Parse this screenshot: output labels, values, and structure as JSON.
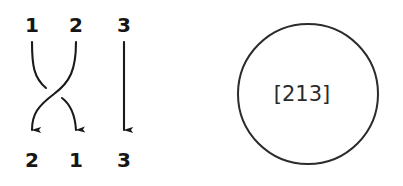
{
  "figure": {
    "background_color": "#ffffff",
    "ink_color": "#1a1a1a",
    "width": 403,
    "height": 186
  },
  "braid_diagram": {
    "name": "permutation-braid-diagram",
    "stroke_color": "#1a1a1a",
    "top_labels": [
      {
        "text": "1",
        "x": 32,
        "y": 25
      },
      {
        "text": "2",
        "x": 76,
        "y": 25
      },
      {
        "text": "3",
        "x": 124,
        "y": 25
      }
    ],
    "bottom_labels": [
      {
        "text": "2",
        "x": 32,
        "y": 160
      },
      {
        "text": "1",
        "x": 76,
        "y": 160
      },
      {
        "text": "3",
        "x": 124,
        "y": 160
      }
    ],
    "strands": [
      {
        "id": "strand-1-to-2",
        "from_position": 1,
        "to_position": 2,
        "crossing": "under",
        "broken": true
      },
      {
        "id": "strand-2-to-1",
        "from_position": 2,
        "to_position": 1,
        "crossing": "over",
        "broken": false
      },
      {
        "id": "strand-3-to-3",
        "from_position": 3,
        "to_position": 3,
        "crossing": "none",
        "broken": false
      }
    ]
  },
  "cycle_notation": {
    "name": "permutation-circle",
    "label": "[213]",
    "circle": {
      "center_x": 107,
      "center_y": 94,
      "radius": 70,
      "stroke_color": "#2b2b2b",
      "fill_color": "#ffffff"
    },
    "label_x": 107,
    "label_y": 94
  }
}
